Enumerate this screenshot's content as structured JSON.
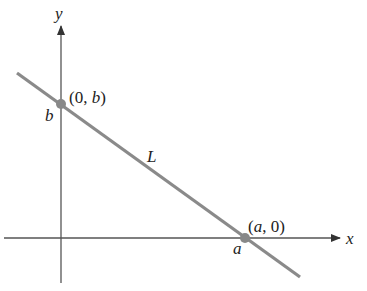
{
  "diagram": {
    "type": "line-intercepts",
    "axes": {
      "x_label": "x",
      "y_label": "y",
      "color": "#555555"
    },
    "line": {
      "label": "L",
      "color": "#8a8a8a"
    },
    "points": [
      {
        "name": "y-intercept",
        "coord_label": "(0, b)",
        "coord_open": "(0, ",
        "coord_var": "b",
        "coord_close": ")",
        "axis_label": "b",
        "color": "#888888"
      },
      {
        "name": "x-intercept",
        "coord_label": "(a, 0)",
        "coord_open": "(",
        "coord_var": "a",
        "coord_close": ", 0)",
        "axis_label": "a",
        "color": "#888888"
      }
    ]
  }
}
